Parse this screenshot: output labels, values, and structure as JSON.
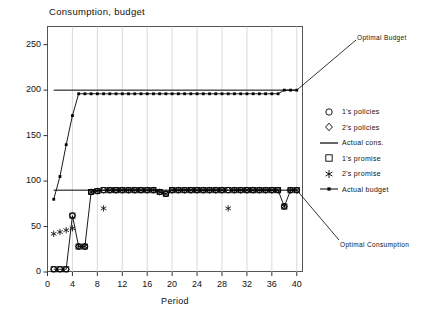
{
  "chart_data": {
    "type": "line",
    "title": "Consumption, budget",
    "xlabel": "Period",
    "ylabel": "",
    "xlim": [
      0,
      41
    ],
    "ylim": [
      0,
      270
    ],
    "xticks": [
      0,
      4,
      8,
      12,
      16,
      20,
      24,
      28,
      32,
      36,
      40
    ],
    "yticks": [
      0,
      50,
      100,
      150,
      200,
      250
    ],
    "grid": "vertical",
    "legend_position": "right",
    "annotations": [
      {
        "text": "Optimal Budget",
        "x": 40,
        "y": 200
      },
      {
        "text": "Optimal Consumption",
        "x": 40,
        "y": 90
      }
    ],
    "series": [
      {
        "name": "1's policies",
        "marker": "circle",
        "x": [
          1,
          2,
          3,
          4,
          5,
          6,
          7,
          8,
          9,
          10,
          11,
          12,
          13,
          14,
          15,
          16,
          17,
          18,
          19,
          20,
          21,
          22,
          23,
          24,
          25,
          26,
          27,
          28,
          29,
          30,
          31,
          32,
          33,
          34,
          35,
          36,
          37,
          38,
          39,
          40
        ],
        "values": [
          3,
          3,
          3,
          62,
          28,
          28,
          88,
          89,
          90,
          90,
          90,
          90,
          90,
          90,
          90,
          90,
          90,
          88,
          86,
          90,
          90,
          90,
          90,
          90,
          90,
          90,
          90,
          90,
          90,
          90,
          90,
          90,
          90,
          90,
          90,
          90,
          90,
          72,
          90,
          90
        ]
      },
      {
        "name": "2's policies",
        "marker": "diamond",
        "x": [
          1,
          2,
          3,
          4,
          5,
          6,
          7,
          8,
          9,
          10,
          11,
          12,
          13,
          14,
          15,
          16,
          17,
          18,
          19,
          20,
          21,
          22,
          23,
          24,
          25,
          26,
          27,
          28,
          29,
          30,
          31,
          32,
          33,
          34,
          35,
          36,
          37,
          38,
          39,
          40
        ],
        "values": [
          3,
          3,
          3,
          62,
          28,
          28,
          88,
          89,
          90,
          90,
          90,
          90,
          90,
          90,
          90,
          90,
          90,
          88,
          86,
          90,
          90,
          90,
          90,
          90,
          90,
          90,
          90,
          90,
          90,
          90,
          90,
          90,
          90,
          90,
          90,
          90,
          90,
          72,
          90,
          90
        ]
      },
      {
        "name": "Actual cons.",
        "marker": "line",
        "x": [
          1,
          2,
          3,
          4,
          5,
          6,
          7,
          8,
          9,
          10,
          11,
          12,
          13,
          14,
          15,
          16,
          17,
          18,
          19,
          20,
          21,
          22,
          23,
          24,
          25,
          26,
          27,
          28,
          29,
          30,
          31,
          32,
          33,
          34,
          35,
          36,
          37,
          38,
          39,
          40
        ],
        "values": [
          3,
          3,
          3,
          62,
          28,
          28,
          88,
          89,
          90,
          90,
          90,
          90,
          90,
          90,
          90,
          90,
          90,
          88,
          86,
          90,
          90,
          90,
          90,
          90,
          90,
          90,
          90,
          90,
          90,
          90,
          90,
          90,
          90,
          90,
          90,
          90,
          90,
          72,
          90,
          90
        ]
      },
      {
        "name": "1's promise",
        "marker": "square",
        "x": [
          1,
          2,
          3,
          4,
          5,
          6,
          7,
          8,
          9,
          10,
          11,
          12,
          13,
          14,
          15,
          16,
          17,
          18,
          19,
          20,
          21,
          22,
          23,
          24,
          25,
          26,
          27,
          28,
          29,
          30,
          31,
          32,
          33,
          34,
          35,
          36,
          37,
          38,
          39,
          40
        ],
        "values": [
          3,
          3,
          3,
          62,
          28,
          28,
          88,
          89,
          90,
          90,
          90,
          90,
          90,
          90,
          90,
          90,
          90,
          88,
          86,
          90,
          90,
          90,
          90,
          90,
          90,
          90,
          90,
          90,
          90,
          90,
          90,
          90,
          90,
          90,
          90,
          90,
          90,
          72,
          90,
          90
        ]
      },
      {
        "name": "2's promise",
        "marker": "asterisk",
        "x": [
          1,
          2,
          3,
          4,
          5,
          6,
          7,
          8,
          9,
          10,
          11,
          12,
          13,
          14,
          15,
          16,
          17,
          18,
          19,
          20,
          21,
          22,
          23,
          24,
          25,
          26,
          27,
          28,
          29,
          30,
          31,
          32,
          33,
          34,
          35,
          36,
          37,
          38,
          39,
          40
        ],
        "values": [
          42,
          44,
          46,
          48,
          28,
          28,
          88,
          89,
          70,
          90,
          90,
          90,
          90,
          90,
          90,
          90,
          90,
          88,
          86,
          90,
          90,
          90,
          90,
          90,
          90,
          90,
          90,
          90,
          70,
          90,
          90,
          90,
          90,
          90,
          90,
          90,
          90,
          72,
          90,
          90
        ]
      },
      {
        "name": "Actual budget",
        "marker": "line-dot",
        "x": [
          1,
          2,
          3,
          4,
          5,
          6,
          7,
          8,
          9,
          10,
          11,
          12,
          13,
          14,
          15,
          16,
          17,
          18,
          19,
          20,
          21,
          22,
          23,
          24,
          25,
          26,
          27,
          28,
          29,
          30,
          31,
          32,
          33,
          34,
          35,
          36,
          37,
          38,
          39,
          40
        ],
        "values": [
          80,
          105,
          140,
          172,
          196,
          196,
          196,
          196,
          196,
          196,
          196,
          196,
          196,
          196,
          196,
          196,
          196,
          196,
          196,
          196,
          196,
          196,
          196,
          196,
          196,
          196,
          196,
          196,
          196,
          196,
          196,
          196,
          196,
          196,
          196,
          196,
          196,
          200,
          200,
          200
        ]
      },
      {
        "name": "Optimal budget reference",
        "marker": "line",
        "x": [
          1,
          40
        ],
        "values": [
          200,
          200
        ]
      },
      {
        "name": "Optimal consumption reference",
        "marker": "line",
        "x": [
          1,
          40
        ],
        "values": [
          90,
          90
        ]
      }
    ]
  },
  "legend": {
    "items": [
      {
        "label": "1's policies",
        "marker": "circle"
      },
      {
        "label": "2's policies",
        "marker": "diamond"
      },
      {
        "label": "Actual cons.",
        "marker": "line"
      },
      {
        "label": "1's promise",
        "marker": "square"
      },
      {
        "label": "2's promise",
        "marker": "asterisk"
      },
      {
        "label": "Actual budget",
        "marker": "line-dot"
      }
    ]
  }
}
